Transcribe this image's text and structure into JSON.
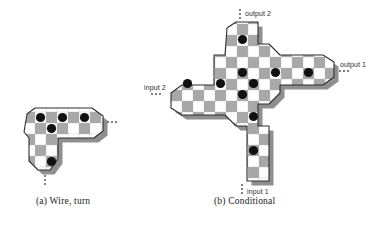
{
  "figure": {
    "panels": [
      {
        "id": "a",
        "caption": "(a) Wire, turn",
        "ports": [],
        "continuation_marks": [
          "horizontal-ellipsis-right",
          "vertical-ellipsis-bottom"
        ]
      },
      {
        "id": "b",
        "caption": "(b) Conditional",
        "ports": [
          {
            "name": "output 2",
            "label": "output 2",
            "side": "top",
            "mark": "vertical-ellipsis"
          },
          {
            "name": "output 1",
            "label": "output 1",
            "side": "right",
            "mark": "horizontal-ellipsis"
          },
          {
            "name": "input 2",
            "label": "input 2",
            "side": "left",
            "mark": "horizontal-ellipsis"
          },
          {
            "name": "input 1",
            "label": "input 1",
            "side": "bottom",
            "mark": "vertical-ellipsis"
          }
        ]
      }
    ],
    "colors": {
      "cell_light": "#ffffff",
      "cell_dark": "#a8a8a8",
      "disc": "#111111",
      "outline": "#2e2e2e",
      "shadow": "#8c8c8c",
      "background": "#ffffff",
      "text": "#1a1a1a"
    },
    "geometry": {
      "cell_size": 11,
      "disc_radius": 4.4
    },
    "panel_a": {
      "origin": [
        24,
        112
      ],
      "cells": [
        {
          "c": 0,
          "r": 0,
          "shade": "dark"
        },
        {
          "c": 1,
          "r": 0,
          "shade": "light"
        },
        {
          "c": 2,
          "r": 0,
          "shade": "dark"
        },
        {
          "c": 3,
          "r": 0,
          "shade": "light"
        },
        {
          "c": 4,
          "r": 0,
          "shade": "dark"
        },
        {
          "c": 5,
          "r": 0,
          "shade": "light"
        },
        {
          "c": 0,
          "r": 1,
          "shade": "light"
        },
        {
          "c": 1,
          "r": 1,
          "shade": "dark"
        },
        {
          "c": 2,
          "r": 1,
          "shade": "light"
        },
        {
          "c": 3,
          "r": 1,
          "shade": "dark"
        },
        {
          "c": 4,
          "r": 1,
          "shade": "light"
        },
        {
          "c": 5,
          "r": 1,
          "shade": "dark"
        },
        {
          "c": 0,
          "r": 2,
          "shade": "dark"
        },
        {
          "c": 1,
          "r": 2,
          "shade": "light"
        },
        {
          "c": 2,
          "r": 2,
          "shade": "dark"
        },
        {
          "c": 0,
          "r": 3,
          "shade": "light"
        },
        {
          "c": 1,
          "r": 3,
          "shade": "dark"
        },
        {
          "c": 2,
          "r": 3,
          "shade": "light"
        },
        {
          "c": 1,
          "r": 4,
          "shade": "light"
        },
        {
          "c": 2,
          "r": 4,
          "shade": "dark"
        }
      ],
      "discs": [
        {
          "c": 0,
          "r": 0
        },
        {
          "c": 2,
          "r": 0
        },
        {
          "c": 4,
          "r": 0
        },
        {
          "c": 1,
          "r": 1
        },
        {
          "c": 1,
          "r": 3
        }
      ]
    },
    "panel_b": {
      "origin": [
        172,
        24
      ],
      "cells": [
        {
          "c": 5,
          "r": 0,
          "shade": "light"
        },
        {
          "c": 6,
          "r": 0,
          "shade": "dark"
        },
        {
          "c": 5,
          "r": 1,
          "shade": "dark"
        },
        {
          "c": 6,
          "r": 1,
          "shade": "light"
        },
        {
          "c": 4,
          "r": 2,
          "shade": "light"
        },
        {
          "c": 5,
          "r": 2,
          "shade": "light"
        },
        {
          "c": 6,
          "r": 2,
          "shade": "dark"
        },
        {
          "c": 7,
          "r": 2,
          "shade": "light"
        },
        {
          "c": 8,
          "r": 2,
          "shade": "dark"
        },
        {
          "c": 1,
          "r": 3,
          "shade": "dark"
        },
        {
          "c": 2,
          "r": 3,
          "shade": "light"
        },
        {
          "c": 3,
          "r": 3,
          "shade": "dark"
        },
        {
          "c": 4,
          "r": 3,
          "shade": "light"
        },
        {
          "c": 5,
          "r": 3,
          "shade": "dark"
        },
        {
          "c": 6,
          "r": 3,
          "shade": "light"
        },
        {
          "c": 7,
          "r": 3,
          "shade": "dark"
        },
        {
          "c": 8,
          "r": 3,
          "shade": "light"
        },
        {
          "c": 0,
          "r": 4,
          "shade": "light"
        },
        {
          "c": 1,
          "r": 4,
          "shade": "light"
        },
        {
          "c": 2,
          "r": 4,
          "shade": "dark"
        },
        {
          "c": 3,
          "r": 4,
          "shade": "light"
        },
        {
          "c": 4,
          "r": 4,
          "shade": "dark"
        },
        {
          "c": 5,
          "r": 4,
          "shade": "light"
        },
        {
          "c": 6,
          "r": 4,
          "shade": "dark"
        },
        {
          "c": 7,
          "r": 4,
          "shade": "light"
        },
        {
          "c": 8,
          "r": 4,
          "shade": "dark"
        },
        {
          "c": 0,
          "r": 5,
          "shade": "dark"
        },
        {
          "c": 1,
          "r": 5,
          "shade": "light"
        },
        {
          "c": 2,
          "r": 5,
          "shade": "light"
        },
        {
          "c": 3,
          "r": 5,
          "shade": "dark"
        },
        {
          "c": 4,
          "r": 5,
          "shade": "light"
        },
        {
          "c": 5,
          "r": 5,
          "shade": "dark"
        },
        {
          "c": 6,
          "r": 5,
          "shade": "light"
        },
        {
          "c": 2,
          "r": 6,
          "shade": "light"
        },
        {
          "c": 3,
          "r": 6,
          "shade": "light"
        },
        {
          "c": 4,
          "r": 6,
          "shade": "dark"
        },
        {
          "c": 5,
          "r": 6,
          "shade": "light"
        },
        {
          "c": 4,
          "r": 7,
          "shade": "light"
        },
        {
          "c": 5,
          "r": 7,
          "shade": "dark"
        },
        {
          "c": 4,
          "r": 8,
          "shade": "dark"
        },
        {
          "c": 5,
          "r": 8,
          "shade": "light"
        },
        {
          "c": 4,
          "r": 9,
          "shade": "light"
        },
        {
          "c": 5,
          "r": 9,
          "shade": "dark"
        }
      ],
      "discs": [
        {
          "c": 5,
          "r": 1
        },
        {
          "c": 5,
          "r": 3
        },
        {
          "c": 7,
          "r": 3
        },
        {
          "c": 1,
          "r": 4
        },
        {
          "c": 3,
          "r": 4
        },
        {
          "c": 5,
          "r": 4
        },
        {
          "c": 4,
          "r": 5
        },
        {
          "c": 4,
          "r": 6
        },
        {
          "c": 5,
          "r": 8
        },
        {
          "c": 9,
          "r": 3
        }
      ]
    }
  }
}
